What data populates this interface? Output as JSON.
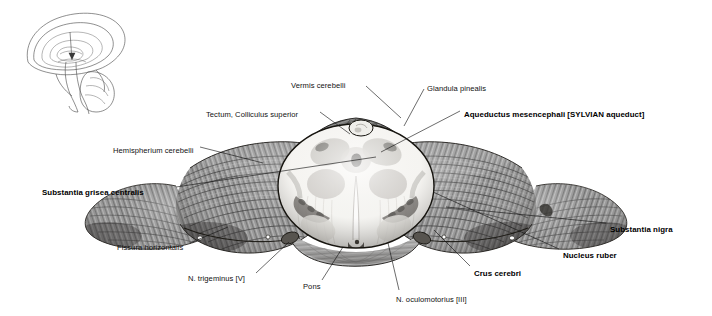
{
  "figure": {
    "type": "anatomical-illustration",
    "background_color": "#ffffff",
    "ink_color": "#111111"
  },
  "inset": {
    "name": "sagittal-brain-orientation-diagram",
    "description": "median sagittal outline of the brain with arrow marking the section plane"
  },
  "labels": [
    {
      "id": "vermis-cerebelli",
      "text": "Vermis cerebelli",
      "bold": false,
      "align": "left",
      "x": 291,
      "y": 82,
      "lx1": 366,
      "ly1": 86,
      "lx2": 401,
      "ly2": 118
    },
    {
      "id": "glandula-pinealis",
      "text": "Glandula pinealis",
      "bold": false,
      "align": "left",
      "x": 427,
      "y": 85,
      "lx1": 424,
      "ly1": 89,
      "lx2": 404,
      "ly2": 126
    },
    {
      "id": "tectum-colliculus",
      "text": "Tectum, Colliculus superior",
      "bold": false,
      "align": "left",
      "x": 206,
      "y": 111,
      "lx1": 320,
      "ly1": 112,
      "lx2": 350,
      "ly2": 134
    },
    {
      "id": "aqueductus-mesencephali",
      "text": "Aqueductus mesencephali [SYLVIAN aqueduct]",
      "bold": true,
      "align": "left",
      "x": 464,
      "y": 111,
      "lx1": 460,
      "ly1": 111,
      "lx2": 381,
      "ly2": 152
    },
    {
      "id": "hemispherium-cerebelli",
      "text": "Hemispherium cerebelli",
      "bold": false,
      "align": "left",
      "x": 113,
      "y": 147,
      "lx1": 200,
      "ly1": 147,
      "lx2": 263,
      "ly2": 163
    },
    {
      "id": "substantia-grisea",
      "text": "Substantia grisea centralis",
      "bold": true,
      "align": "left",
      "x": 42,
      "y": 189,
      "lx1": 176,
      "ly1": 187,
      "lx2": 376,
      "ly2": 157
    },
    {
      "id": "fissura-horizontalis",
      "text": "Fissura horizontalis",
      "bold": false,
      "align": "left",
      "x": 117,
      "y": 244,
      "lx1": 190,
      "ly1": 243,
      "lx2": 228,
      "ly2": 227
    },
    {
      "id": "n-trigeminus",
      "text": "N. trigeminus [V]",
      "bold": false,
      "align": "left",
      "x": 188,
      "y": 275,
      "lx1": 256,
      "ly1": 273,
      "lx2": 289,
      "ly2": 242
    },
    {
      "id": "pons",
      "text": "Pons",
      "bold": false,
      "align": "left",
      "x": 303,
      "y": 283,
      "lx1": 322,
      "ly1": 280,
      "lx2": 343,
      "ly2": 247
    },
    {
      "id": "n-oculomotorius",
      "text": "N. oculomotorius [III]",
      "bold": false,
      "align": "left",
      "x": 396,
      "y": 296,
      "lx1": 399,
      "ly1": 290,
      "lx2": 388,
      "ly2": 243
    },
    {
      "id": "crus-cerebri",
      "text": "Crus cerebri",
      "bold": true,
      "align": "left",
      "x": 474,
      "y": 270,
      "lx1": 470,
      "ly1": 266,
      "lx2": 434,
      "ly2": 230
    },
    {
      "id": "nucleus-ruber",
      "text": "Nucleus ruber",
      "bold": true,
      "align": "left",
      "x": 563,
      "y": 252,
      "lx1": 559,
      "ly1": 249,
      "lx2": 433,
      "ly2": 192
    },
    {
      "id": "substantia-nigra",
      "text": "Substantia nigra",
      "bold": true,
      "align": "left",
      "x": 610,
      "y": 226,
      "lx1": 606,
      "ly1": 223,
      "lx2": 446,
      "ly2": 207
    }
  ]
}
